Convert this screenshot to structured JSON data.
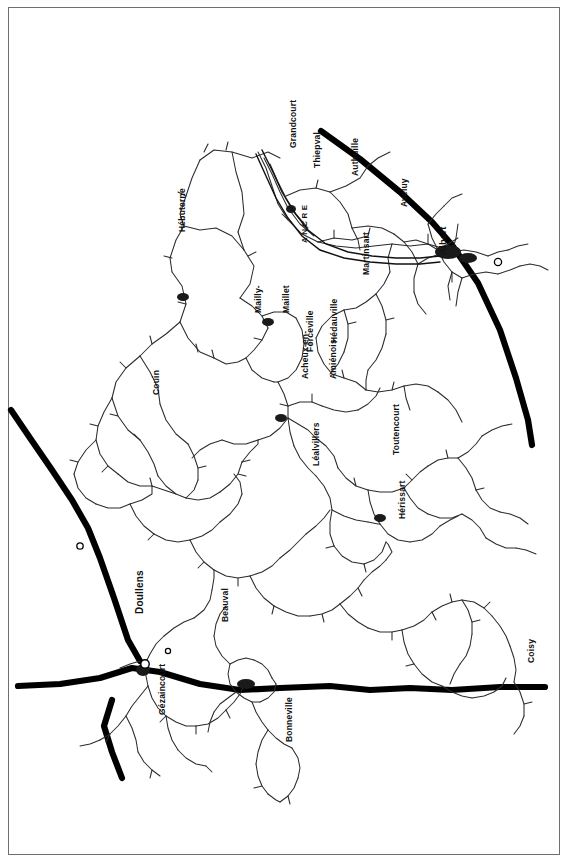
{
  "map": {
    "title": "Somme battlefield area road map",
    "orientation_note": "labels rotated 90 degrees counter-clockwise",
    "background_color": "#ffffff",
    "ink_color": "#111111",
    "frame_color": "#6e6e6e",
    "road_major_color": "#000000",
    "road_minor_color": "#2b2b2b",
    "settlements": [
      {
        "name": "Grandcourt",
        "x": 289,
        "y": 148,
        "rotation": -90,
        "lines": [
          "Grandcourt"
        ]
      },
      {
        "name": "Thiepval",
        "x": 313,
        "y": 168,
        "rotation": -90,
        "lines": [
          "Thiepval"
        ]
      },
      {
        "name": "Authuille",
        "x": 351,
        "y": 176,
        "rotation": -90,
        "lines": [
          "Authuille"
        ]
      },
      {
        "name": "Aveluy",
        "x": 400,
        "y": 207,
        "rotation": -90,
        "lines": [
          "Aveluy"
        ]
      },
      {
        "name": "Albert",
        "x": 438,
        "y": 255,
        "rotation": -90,
        "lines": [
          "Albert"
        ]
      },
      {
        "name": "Hébuterne",
        "x": 178,
        "y": 232,
        "rotation": -90,
        "lines": [
          "Hébuterne"
        ]
      },
      {
        "name": "Martinsart",
        "x": 362,
        "y": 275,
        "rotation": -90,
        "lines": [
          "Martinsart"
        ]
      },
      {
        "name": "Mailly-Maillet",
        "x": 236,
        "y": 313,
        "rotation": -90,
        "lines": [
          "Mailly-",
          "Maillet"
        ]
      },
      {
        "name": "Hédauville",
        "x": 330,
        "y": 343,
        "rotation": -90,
        "lines": [
          "Hédauville"
        ]
      },
      {
        "name": "Forceville",
        "x": 306,
        "y": 352,
        "rotation": -90,
        "lines": [
          "Forceville"
        ]
      },
      {
        "name": "Acheux-en-Amiénois",
        "x": 283,
        "y": 379,
        "rotation": -90,
        "lines": [
          "Acheux-en-",
          "Amiénois"
        ]
      },
      {
        "name": "Couin",
        "x": 152,
        "y": 395,
        "rotation": -90,
        "lines": [
          "Couin"
        ]
      },
      {
        "name": "Léalvillers",
        "x": 312,
        "y": 466,
        "rotation": -90,
        "lines": [
          "Léalvillers"
        ]
      },
      {
        "name": "Toutencourt",
        "x": 392,
        "y": 455,
        "rotation": -90,
        "lines": [
          "Toutencourt"
        ]
      },
      {
        "name": "Hérissart",
        "x": 398,
        "y": 519,
        "rotation": -90,
        "lines": [
          "Hérissart"
        ]
      },
      {
        "name": "Doullens",
        "x": 135,
        "y": 614,
        "rotation": -90,
        "lines": [
          "Doullens"
        ]
      },
      {
        "name": "Beauval",
        "x": 221,
        "y": 622,
        "rotation": -90,
        "lines": [
          "Beauval"
        ]
      },
      {
        "name": "Gézaincourt",
        "x": 158,
        "y": 715,
        "rotation": -90,
        "lines": [
          "Gézaincourt"
        ]
      },
      {
        "name": "Bonneville",
        "x": 285,
        "y": 742,
        "rotation": -90,
        "lines": [
          "Bonneville"
        ]
      },
      {
        "name": "Coisy",
        "x": 527,
        "y": 663,
        "rotation": -90,
        "lines": [
          "Coisy"
        ]
      }
    ],
    "rivers": [
      {
        "name": "ANCRE",
        "x": 300,
        "y": 243,
        "rotation": -90,
        "label": "ANCRE"
      }
    ],
    "road_classes": [
      {
        "id": "major",
        "label": "main road",
        "width": 6.5,
        "color": "#000000"
      },
      {
        "id": "minor",
        "label": "secondary road",
        "width": 1.1,
        "color": "#2b2b2b"
      }
    ]
  }
}
